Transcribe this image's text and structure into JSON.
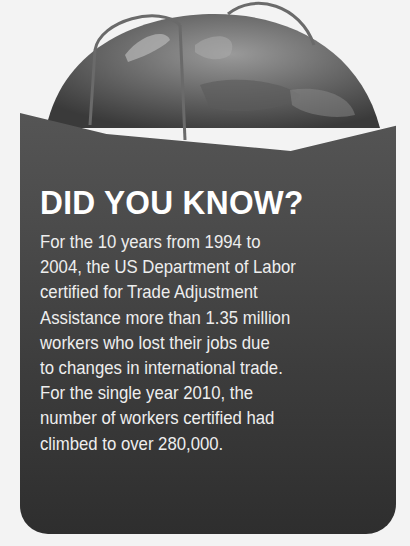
{
  "callout": {
    "title": "DID YOU KNOW?",
    "lines": [
      "For the 10 years from 1994 to",
      "2004, the US Department of Labor",
      "certified for Trade Adjustment",
      "Assistance more than 1.35 million",
      "workers who lost their jobs due",
      "to changes in international trade.",
      "For the single year 2010, the",
      "number of workers certified had",
      "climbed to over 280,000."
    ],
    "illustration": "globe-in-shopping-bag",
    "colors": {
      "bag": "#4a4a4a",
      "bag_bottom": "#2e2e2e",
      "text": "#f2f2f2",
      "background": "#f3f3f3"
    }
  }
}
